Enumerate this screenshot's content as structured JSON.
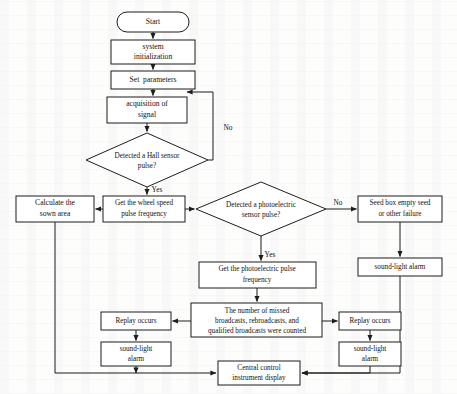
{
  "diagram": {
    "type": "flowchart",
    "canvas": {
      "width": 457,
      "height": 394
    },
    "stroke_color": "#1d1d1d",
    "fill_color": "#ffffff",
    "background_color": "#fdfdfc"
  },
  "nodes": [
    {
      "id": "start",
      "shape": "terminator",
      "label": "Start",
      "lines": [
        "Start"
      ],
      "x": 117,
      "y": 12,
      "w": 72,
      "h": 20
    },
    {
      "id": "system_init",
      "shape": "process",
      "label": "system initialization",
      "lines": [
        "system",
        "initialization"
      ],
      "x": 111,
      "y": 40,
      "w": 84,
      "h": 24
    },
    {
      "id": "set_parameters",
      "shape": "process",
      "label": "Set  parameters",
      "lines": [
        "Set  parameters"
      ],
      "x": 111,
      "y": 71,
      "w": 84,
      "h": 18
    },
    {
      "id": "acquisition",
      "shape": "process",
      "label": "acquisition of signal",
      "lines": [
        "acquisition of",
        "signal"
      ],
      "x": 107,
      "y": 97,
      "w": 80,
      "h": 26
    },
    {
      "id": "hall_decision",
      "shape": "decision",
      "label": "Detected a Hall sensor pulse?",
      "lines": [
        "Detected a Hall sensor",
        "pulse?"
      ],
      "x": 86,
      "y": 133,
      "w": 122,
      "h": 54
    },
    {
      "id": "wheel_speed",
      "shape": "process",
      "label": "Get the wheel speed pulse frequency",
      "lines": [
        "Get the wheel speed",
        "pulse frequency"
      ],
      "x": 103,
      "y": 196,
      "w": 82,
      "h": 26
    },
    {
      "id": "calculate_area",
      "shape": "process",
      "label": "Calculate the sown area",
      "lines": [
        "Calculate the",
        "sown area"
      ],
      "x": 16,
      "y": 196,
      "w": 78,
      "h": 26
    },
    {
      "id": "photo_decision",
      "shape": "decision",
      "label": "Detected a photoelectric sensor pulse?",
      "lines": [
        "Detected a photoelectric",
        "sensor pulse?"
      ],
      "x": 196,
      "y": 182,
      "w": 130,
      "h": 54
    },
    {
      "id": "seed_box_fail",
      "shape": "process",
      "label": "Seed box empty seed or other failure",
      "lines": [
        "Seed box empty seed",
        "or other failure"
      ],
      "x": 358,
      "y": 196,
      "w": 84,
      "h": 26
    },
    {
      "id": "alarm_right_top",
      "shape": "process",
      "label": "sound-light alarm",
      "lines": [
        "sound-light alarm"
      ],
      "x": 358,
      "y": 258,
      "w": 84,
      "h": 18
    },
    {
      "id": "photo_pulse_freq",
      "shape": "process",
      "label": "Get the photoelectric pulse frequency",
      "lines": [
        "Get the photoelectric pulse",
        "frequency"
      ],
      "x": 199,
      "y": 262,
      "w": 117,
      "h": 26
    },
    {
      "id": "count_broadcasts",
      "shape": "process",
      "label": "The number of missed broadcasts, rebroadcasts, and qualified broadcasts were counted",
      "lines": [
        "The number of missed",
        "broadcasts, rebroadcasts, and",
        "qualified broadcasts were counted"
      ],
      "x": 191,
      "y": 303,
      "w": 131,
      "h": 34
    },
    {
      "id": "replay_left",
      "shape": "process",
      "label": "Replay occurs",
      "lines": [
        "Replay occurs"
      ],
      "x": 101,
      "y": 312,
      "w": 70,
      "h": 18
    },
    {
      "id": "alarm_left",
      "shape": "process",
      "label": "sound-light alarm",
      "lines": [
        "sound-light",
        "alarm"
      ],
      "x": 101,
      "y": 342,
      "w": 70,
      "h": 24
    },
    {
      "id": "replay_right",
      "shape": "process",
      "label": "Replay occurs",
      "lines": [
        "Replay occurs"
      ],
      "x": 339,
      "y": 312,
      "w": 62,
      "h": 18
    },
    {
      "id": "alarm_right_bottom",
      "shape": "process",
      "label": "sound-light alarm",
      "lines": [
        "sound-light",
        "alarm"
      ],
      "x": 339,
      "y": 342,
      "w": 62,
      "h": 24
    },
    {
      "id": "central_display",
      "shape": "process",
      "label": "Central control instrument display",
      "lines": [
        "Central control",
        "instrument display"
      ],
      "x": 218,
      "y": 361,
      "w": 82,
      "h": 24
    }
  ],
  "edge_labels": [
    {
      "id": "hall_no",
      "text": "No",
      "x": 228,
      "y": 128
    },
    {
      "id": "hall_yes",
      "text": "Yes",
      "x": 157,
      "y": 190
    },
    {
      "id": "photo_no",
      "text": "No",
      "x": 338,
      "y": 203
    },
    {
      "id": "photo_yes",
      "text": "Yes",
      "x": 270,
      "y": 255
    }
  ],
  "edges": [
    {
      "id": "start-to-init",
      "from": "start",
      "to": "system_init",
      "kind": "arrow"
    },
    {
      "id": "init-to-params",
      "from": "system_init",
      "to": "set_parameters",
      "kind": "arrow"
    },
    {
      "id": "params-to-acquisition",
      "from": "set_parameters",
      "to": "acquisition",
      "kind": "arrow"
    },
    {
      "id": "acquisition-to-hall",
      "from": "acquisition",
      "to": "hall_decision",
      "kind": "arrow"
    },
    {
      "id": "hall-no-loop",
      "from": "hall_decision",
      "to": "acquisition",
      "kind": "arrow",
      "label": "No"
    },
    {
      "id": "hall-yes-to-wheel",
      "from": "hall_decision",
      "to": "wheel_speed",
      "kind": "arrow",
      "label": "Yes"
    },
    {
      "id": "wheel-to-calculate",
      "from": "wheel_speed",
      "to": "calculate_area",
      "kind": "arrow"
    },
    {
      "id": "wheel-to-photo",
      "from": "wheel_speed",
      "to": "photo_decision",
      "kind": "arrow"
    },
    {
      "id": "photo-no-to-seedbox",
      "from": "photo_decision",
      "to": "seed_box_fail",
      "kind": "arrow",
      "label": "No"
    },
    {
      "id": "seedbox-to-alarm",
      "from": "seed_box_fail",
      "to": "alarm_right_top",
      "kind": "arrow"
    },
    {
      "id": "photo-yes-to-freq",
      "from": "photo_decision",
      "to": "photo_pulse_freq",
      "kind": "arrow",
      "label": "Yes"
    },
    {
      "id": "freq-to-count",
      "from": "photo_pulse_freq",
      "to": "count_broadcasts",
      "kind": "arrow"
    },
    {
      "id": "count-to-replay-left",
      "from": "count_broadcasts",
      "to": "replay_left",
      "kind": "arrow"
    },
    {
      "id": "count-to-replay-right",
      "from": "count_broadcasts",
      "to": "replay_right",
      "kind": "arrow"
    },
    {
      "id": "replay-left-to-alarm",
      "from": "replay_left",
      "to": "alarm_left",
      "kind": "arrow"
    },
    {
      "id": "replay-right-to-alarm",
      "from": "replay_right",
      "to": "alarm_right_bottom",
      "kind": "arrow"
    },
    {
      "id": "calculate-to-central",
      "from": "calculate_area",
      "to": "central_display",
      "kind": "arrow"
    },
    {
      "id": "alarm-left-to-central",
      "from": "alarm_left",
      "to": "central_display",
      "kind": "arrow"
    },
    {
      "id": "alarm-right-bottom-to-central",
      "from": "alarm_right_bottom",
      "to": "central_display",
      "kind": "arrow"
    },
    {
      "id": "alarm-right-top-to-central",
      "from": "alarm_right_top",
      "to": "central_display",
      "kind": "arrow"
    }
  ]
}
